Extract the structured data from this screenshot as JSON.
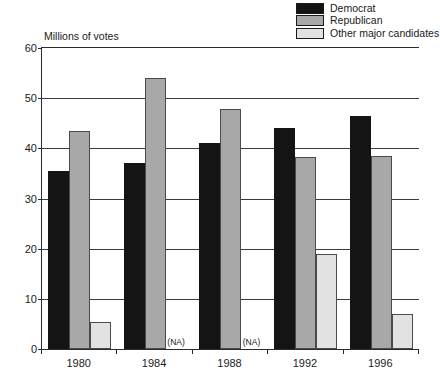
{
  "chart_data": {
    "type": "bar",
    "title": "",
    "ylabel": "Millions of votes",
    "xlabel": "",
    "ylim": [
      0,
      60
    ],
    "yticks": [
      0,
      10,
      20,
      30,
      40,
      50,
      60
    ],
    "grid": true,
    "legend_position": "top-right",
    "categories": [
      "1980",
      "1984",
      "1988",
      "1992",
      "1996"
    ],
    "series": [
      {
        "name": "Democrat",
        "color": "#141414",
        "values": [
          35.5,
          37.1,
          41.0,
          44.0,
          46.5
        ]
      },
      {
        "name": "Republican",
        "color": "#a8a8a8",
        "values": [
          43.4,
          54.0,
          47.9,
          38.2,
          38.4
        ]
      },
      {
        "name": "Other major candidates",
        "color": "#e2e2e2",
        "values": [
          5.4,
          null,
          null,
          19.0,
          7.0
        ]
      }
    ],
    "annotations": [
      {
        "text": "(NA)",
        "category": "1984",
        "series": "Other major candidates"
      },
      {
        "text": "(NA)",
        "category": "1988",
        "series": "Other major candidates"
      }
    ]
  },
  "legend": {
    "items": [
      {
        "label": "Democrat",
        "swatch": "#141414"
      },
      {
        "label": "Republican",
        "swatch": "#a8a8a8"
      },
      {
        "label": "Other major candidates",
        "swatch": "#e2e2e2"
      }
    ]
  },
  "axes": {
    "y_title": "Millions of votes"
  }
}
